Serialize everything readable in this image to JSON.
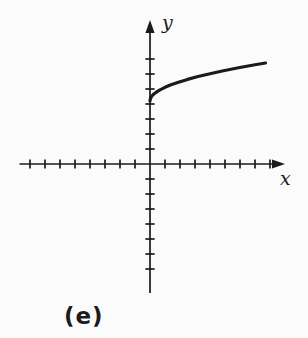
{
  "figure": {
    "caption": "(e)"
  },
  "colors": {
    "ink": "#1b1b1b",
    "background": "#fbfbfb"
  },
  "chart_data": {
    "type": "line",
    "title": "",
    "xlabel": "x",
    "ylabel": "y",
    "xlim": [
      -8.7,
      9.0
    ],
    "ylim": [
      -8.6,
      9.6
    ],
    "x_ticks": [
      -8,
      -7,
      -6,
      -5,
      -4,
      -3,
      -2,
      -1,
      1,
      2,
      3,
      4,
      5,
      6,
      7,
      8
    ],
    "y_ticks": [
      -7,
      -6,
      -5,
      -4,
      -3,
      -2,
      -1,
      1,
      2,
      3,
      4,
      5,
      6,
      7
    ],
    "grid": false,
    "legend": false,
    "axis_arrows": [
      "x-right",
      "y-top"
    ],
    "series": [
      {
        "name": "sqrt-curve",
        "description": "square-root-shaped curve starting on the positive y-axis with a vertical tangent, increasing and concave down",
        "points": [
          [
            0,
            4.2
          ],
          [
            0.02,
            4.33
          ],
          [
            0.05,
            4.4
          ],
          [
            0.1,
            4.49
          ],
          [
            0.2,
            4.61
          ],
          [
            0.3,
            4.7
          ],
          [
            0.5,
            4.84
          ],
          [
            0.7,
            4.96
          ],
          [
            1.0,
            5.11
          ],
          [
            1.4,
            5.28
          ],
          [
            1.9,
            5.45
          ],
          [
            2.5,
            5.64
          ],
          [
            3.2,
            5.83
          ],
          [
            4.0,
            6.02
          ],
          [
            4.9,
            6.21
          ],
          [
            5.9,
            6.41
          ],
          [
            7.0,
            6.61
          ],
          [
            7.7,
            6.73
          ]
        ]
      }
    ]
  }
}
